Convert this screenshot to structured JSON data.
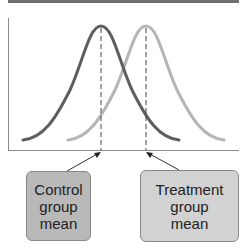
{
  "diagram": {
    "type": "overlapping-normal-distributions",
    "curves": [
      {
        "name": "Control group",
        "color": "#5e5e5e",
        "mean_x": 101
      },
      {
        "name": "Treatment group",
        "color": "#b5b5b5",
        "mean_x": 146
      }
    ],
    "labels": {
      "control": "Control\ngroup\nmean",
      "treatment": "Treatment\ngroup\nmean"
    },
    "colors": {
      "top_bar": "#6f6f6f",
      "axis": "#8a8a8a",
      "control_box": "#b9b9b9",
      "treatment_box": "#d2d2d2"
    }
  }
}
